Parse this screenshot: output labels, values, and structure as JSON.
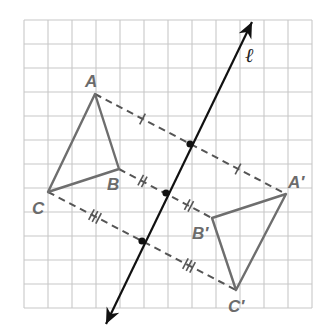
{
  "diagram": {
    "type": "geometric-reflection",
    "grid": {
      "x0": 24,
      "y0": 20,
      "cell": 24,
      "cols": 12,
      "rows": 12,
      "color": "#c8c8c8"
    },
    "colors": {
      "triangle": "#6e6e6e",
      "line": "#111111",
      "dashed": "#555555",
      "label": "#6b6b6b"
    },
    "line": {
      "name": "ℓ",
      "from": [
        106,
        324
      ],
      "to": [
        252,
        22
      ]
    },
    "triangles": [
      {
        "name": "ABC",
        "vertices": {
          "A": [
            95,
            94
          ],
          "B": [
            119,
            169
          ],
          "C": [
            48,
            192
          ]
        }
      },
      {
        "name": "A'B'C'",
        "vertices": {
          "A'": [
            286,
            194
          ],
          "B'": [
            212,
            218
          ],
          "C'": [
            236,
            290
          ]
        }
      }
    ],
    "connectors": [
      {
        "from": "A",
        "to": "A'",
        "midpoint": [
          190,
          144
        ],
        "ticks": 1
      },
      {
        "from": "B",
        "to": "B'",
        "midpoint": [
          166,
          193
        ],
        "ticks": 2
      },
      {
        "from": "C",
        "to": "C'",
        "midpoint": [
          142,
          241
        ],
        "ticks": 3
      }
    ],
    "labels": {
      "A": "A",
      "B": "B",
      "C": "C",
      "A_prime": "A′",
      "B_prime": "B′",
      "C_prime": "C′",
      "line": "ℓ"
    }
  }
}
